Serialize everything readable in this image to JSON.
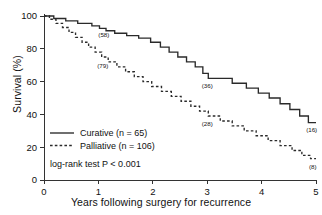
{
  "chart_data": {
    "type": "line",
    "title": "",
    "subtitle": "",
    "xlabel": "Years following surgery for recurrence",
    "ylabel": "Survival (%)",
    "xlim": [
      0,
      5
    ],
    "ylim": [
      0,
      100
    ],
    "xticks": [
      "0",
      "1",
      "2",
      "3",
      "4",
      "5"
    ],
    "xtick_values": [
      0,
      1,
      2,
      3,
      4,
      5
    ],
    "yticks": [
      "0",
      "20",
      "40",
      "60",
      "80",
      "100"
    ],
    "ytick_values": [
      0,
      20,
      40,
      60,
      80,
      100
    ],
    "grid": false,
    "legend_position": "lower-left",
    "annotation_note": "log-rank test P < 0.001",
    "series": [
      {
        "name": "Curative (n = 65)",
        "label": "Curative",
        "n": 65,
        "style": "solid",
        "color": "#2a2a2a",
        "points": [
          [
            0.0,
            100
          ],
          [
            0.18,
            100
          ],
          [
            0.18,
            98.5
          ],
          [
            0.4,
            98.5
          ],
          [
            0.4,
            97.0
          ],
          [
            0.62,
            97.0
          ],
          [
            0.62,
            95.5
          ],
          [
            0.88,
            95.5
          ],
          [
            0.88,
            94.0
          ],
          [
            1.02,
            94.0
          ],
          [
            1.02,
            92.5
          ],
          [
            1.14,
            92.5
          ],
          [
            1.14,
            91.0
          ],
          [
            1.3,
            91.0
          ],
          [
            1.3,
            89.5
          ],
          [
            1.52,
            89.5
          ],
          [
            1.52,
            88.0
          ],
          [
            1.74,
            88.0
          ],
          [
            1.74,
            86.5
          ],
          [
            1.96,
            86.5
          ],
          [
            1.96,
            84.0
          ],
          [
            2.14,
            84.0
          ],
          [
            2.14,
            81.0
          ],
          [
            2.3,
            81.0
          ],
          [
            2.3,
            78.0
          ],
          [
            2.46,
            78.0
          ],
          [
            2.46,
            75.0
          ],
          [
            2.62,
            75.0
          ],
          [
            2.62,
            72.0
          ],
          [
            2.78,
            72.0
          ],
          [
            2.78,
            69.0
          ],
          [
            2.92,
            69.0
          ],
          [
            2.92,
            65.0
          ],
          [
            3.02,
            65.0
          ],
          [
            3.02,
            62.0
          ],
          [
            3.46,
            62.0
          ],
          [
            3.46,
            59.0
          ],
          [
            3.72,
            59.0
          ],
          [
            3.72,
            56.0
          ],
          [
            3.94,
            56.0
          ],
          [
            3.94,
            53.0
          ],
          [
            4.14,
            53.0
          ],
          [
            4.14,
            50.0
          ],
          [
            4.34,
            50.0
          ],
          [
            4.34,
            46.5
          ],
          [
            4.52,
            46.5
          ],
          [
            4.52,
            43.0
          ],
          [
            4.7,
            43.0
          ],
          [
            4.7,
            39.0
          ],
          [
            4.86,
            39.0
          ],
          [
            4.86,
            35.0
          ],
          [
            5.0,
            35.0
          ]
        ],
        "point_labels": [
          {
            "text": "(58)",
            "x": 1.1,
            "y": 87.0
          },
          {
            "text": "(36)",
            "x": 3.0,
            "y": 56.0
          },
          {
            "text": "(16)",
            "x": 4.92,
            "y": 29.0
          }
        ]
      },
      {
        "name": "Palliative (n = 106)",
        "label": "Palliative",
        "n": 106,
        "style": "dashed",
        "color": "#2a2a2a",
        "points": [
          [
            0.0,
            100
          ],
          [
            0.1,
            100
          ],
          [
            0.1,
            98.0
          ],
          [
            0.22,
            98.0
          ],
          [
            0.22,
            95.5
          ],
          [
            0.34,
            95.5
          ],
          [
            0.34,
            93.0
          ],
          [
            0.46,
            93.0
          ],
          [
            0.46,
            90.0
          ],
          [
            0.58,
            90.0
          ],
          [
            0.58,
            87.0
          ],
          [
            0.7,
            87.0
          ],
          [
            0.7,
            84.0
          ],
          [
            0.82,
            84.0
          ],
          [
            0.82,
            81.0
          ],
          [
            0.94,
            81.0
          ],
          [
            0.94,
            78.0
          ],
          [
            1.06,
            78.0
          ],
          [
            1.06,
            75.0
          ],
          [
            1.18,
            75.0
          ],
          [
            1.18,
            72.0
          ],
          [
            1.34,
            72.0
          ],
          [
            1.34,
            69.0
          ],
          [
            1.5,
            69.0
          ],
          [
            1.5,
            66.0
          ],
          [
            1.66,
            66.0
          ],
          [
            1.66,
            63.0
          ],
          [
            1.82,
            63.0
          ],
          [
            1.82,
            60.0
          ],
          [
            1.98,
            60.0
          ],
          [
            1.98,
            57.0
          ],
          [
            2.16,
            57.0
          ],
          [
            2.16,
            54.0
          ],
          [
            2.34,
            54.0
          ],
          [
            2.34,
            51.0
          ],
          [
            2.52,
            51.0
          ],
          [
            2.52,
            48.0
          ],
          [
            2.7,
            48.0
          ],
          [
            2.7,
            45.0
          ],
          [
            2.86,
            45.0
          ],
          [
            2.86,
            42.0
          ],
          [
            3.02,
            42.0
          ],
          [
            3.02,
            39.0
          ],
          [
            3.24,
            39.0
          ],
          [
            3.24,
            36.0
          ],
          [
            3.46,
            36.0
          ],
          [
            3.46,
            33.0
          ],
          [
            3.68,
            33.0
          ],
          [
            3.68,
            30.0
          ],
          [
            3.9,
            30.0
          ],
          [
            3.9,
            27.0
          ],
          [
            4.12,
            27.0
          ],
          [
            4.12,
            24.0
          ],
          [
            4.34,
            24.0
          ],
          [
            4.34,
            21.0
          ],
          [
            4.56,
            21.0
          ],
          [
            4.56,
            18.0
          ],
          [
            4.74,
            18.0
          ],
          [
            4.74,
            15.0
          ],
          [
            4.9,
            15.0
          ],
          [
            4.9,
            13.0
          ],
          [
            5.0,
            13.0
          ]
        ],
        "point_labels": [
          {
            "text": "(79)",
            "x": 1.08,
            "y": 68.0
          },
          {
            "text": "(28)",
            "x": 3.0,
            "y": 33.0
          },
          {
            "text": "(8)",
            "x": 4.94,
            "y": 7.0
          }
        ]
      }
    ]
  },
  "legend": {
    "items": [
      {
        "label": "Curative (n = 65)",
        "style": "solid"
      },
      {
        "label": "Palliative (n = 106)",
        "style": "dashed"
      }
    ],
    "stat_note": "log-rank test P < 0.001"
  }
}
